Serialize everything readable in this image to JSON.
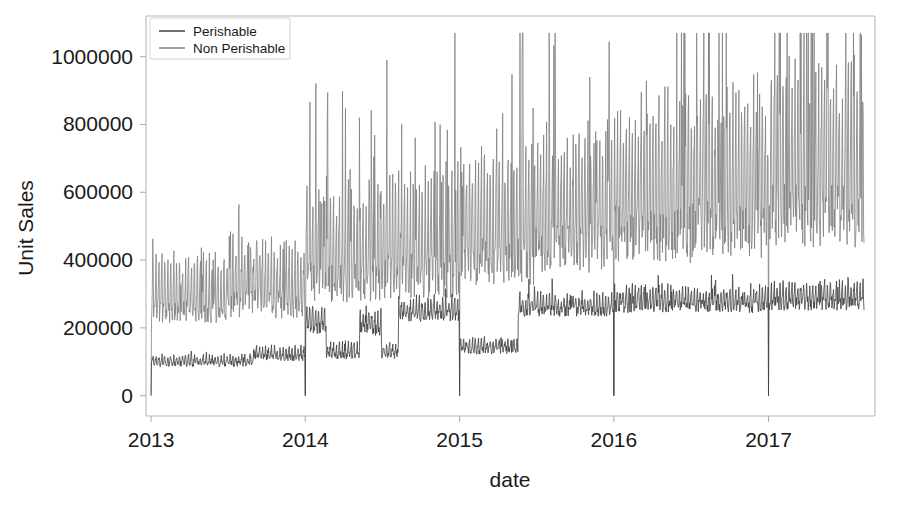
{
  "chart_data": {
    "type": "line",
    "title": "",
    "xlabel": "date",
    "ylabel": "Unit Sales",
    "grid": false,
    "legend_position": "upper left",
    "xlim": [
      "2012-12-20",
      "2017-09-10"
    ],
    "ylim": [
      -60000,
      1120000
    ],
    "yticks": [
      0,
      200000,
      400000,
      600000,
      800000,
      1000000
    ],
    "ytick_labels": [
      "0",
      "200000",
      "400000",
      "600000",
      "800000",
      "1000000"
    ],
    "xticks": [
      "2013",
      "2014",
      "2015",
      "2016",
      "2017"
    ],
    "xtick_labels": [
      "2013",
      "2014",
      "2015",
      "2016",
      "2017"
    ],
    "series": [
      {
        "name": "Perishable",
        "color": "#404040",
        "linewidth": 0.8,
        "description": "Daily perishable unit sales. Baseline ~95000 in early 2013 rising to ~130000 by late 2013; erratic 2014 with several level shifts between 110000 and 250000; ~130000 in early 2015; steps up to ~270000 in mid 2015 and remains near 270000-290000 through 2017. Drops to 0 on Jan 1 of each year.",
        "zero_days": [
          "2013-01-01",
          "2014-01-01",
          "2015-01-01",
          "2016-01-01",
          "2017-01-01"
        ],
        "level_segments": [
          {
            "from": "2013-01-01",
            "to": "2013-09-01",
            "level": 98000,
            "spread": 22000
          },
          {
            "from": "2013-09-01",
            "to": "2014-01-01",
            "level": 118000,
            "spread": 26000
          },
          {
            "from": "2014-01-01",
            "to": "2014-02-20",
            "level": 215000,
            "spread": 55000
          },
          {
            "from": "2014-02-20",
            "to": "2014-05-10",
            "level": 125000,
            "spread": 30000
          },
          {
            "from": "2014-05-10",
            "to": "2014-07-01",
            "level": 205000,
            "spread": 50000
          },
          {
            "from": "2014-07-01",
            "to": "2014-08-10",
            "level": 125000,
            "spread": 28000
          },
          {
            "from": "2014-08-10",
            "to": "2015-01-01",
            "level": 245000,
            "spread": 45000
          },
          {
            "from": "2015-01-01",
            "to": "2015-05-20",
            "level": 140000,
            "spread": 30000
          },
          {
            "from": "2015-05-20",
            "to": "2016-01-01",
            "level": 258000,
            "spread": 42000
          },
          {
            "from": "2016-01-01",
            "to": "2017-01-01",
            "level": 272000,
            "spread": 48000
          },
          {
            "from": "2017-01-01",
            "to": "2017-08-15",
            "level": 282000,
            "spread": 52000
          }
        ],
        "min": 0,
        "max": 390000
      },
      {
        "name": "Non Perishable",
        "color": "#808080",
        "linewidth": 0.8,
        "description": "Daily non-perishable unit sales. Baseline ~270000 in 2013 growing steadily to ~600000 by 2017, with weekly spikes reaching 800000-1070000 in 2016-2017. Drops to 0 on Jan 1 of each year.",
        "zero_days": [
          "2013-01-01",
          "2014-01-01",
          "2015-01-01",
          "2016-01-01",
          "2017-01-01"
        ],
        "level_segments": [
          {
            "from": "2013-01-01",
            "to": "2013-07-01",
            "level": 275000,
            "spread": 95000
          },
          {
            "from": "2013-07-01",
            "to": "2014-01-01",
            "level": 300000,
            "spread": 110000
          },
          {
            "from": "2014-01-01",
            "to": "2014-07-01",
            "level": 380000,
            "spread": 160000
          },
          {
            "from": "2014-07-01",
            "to": "2015-01-01",
            "level": 400000,
            "spread": 180000
          },
          {
            "from": "2015-01-01",
            "to": "2015-07-01",
            "level": 450000,
            "spread": 190000
          },
          {
            "from": "2015-07-01",
            "to": "2016-01-01",
            "level": 490000,
            "spread": 200000
          },
          {
            "from": "2016-01-01",
            "to": "2016-07-01",
            "level": 540000,
            "spread": 230000
          },
          {
            "from": "2016-07-01",
            "to": "2017-01-01",
            "level": 560000,
            "spread": 240000
          },
          {
            "from": "2017-01-01",
            "to": "2017-08-15",
            "level": 600000,
            "spread": 250000
          }
        ],
        "min": 0,
        "max": 1070000
      }
    ],
    "annotations": [
      "Both series collapse to zero on January 1 of every year (store closure).",
      "Perishable series shows a persistent level shift upward around May 2015.",
      "Non Perishable series exhibits strong weekly seasonality with growing amplitude."
    ]
  },
  "legend": {
    "entries": [
      {
        "label": "Perishable",
        "color": "#404040"
      },
      {
        "label": "Non Perishable",
        "color": "#808080"
      }
    ]
  },
  "axes": {
    "ylabel": "Unit Sales",
    "xlabel": "date",
    "ytick_labels": [
      "1000000",
      "800000",
      "600000",
      "400000",
      "200000",
      "0"
    ],
    "xtick_labels": [
      "2013",
      "2014",
      "2015",
      "2016",
      "2017"
    ]
  },
  "figure": {
    "background": "#ffffff",
    "axes_background": "#ffffff",
    "spine_color": "#b8b8b8",
    "text_color": "#1a1a1a"
  }
}
